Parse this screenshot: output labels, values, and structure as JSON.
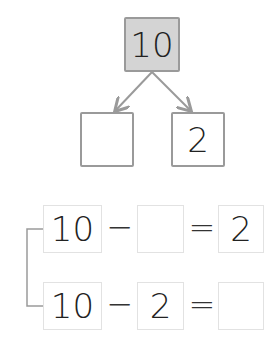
{
  "tree": {
    "whole": "10",
    "parts": [
      "",
      "2"
    ]
  },
  "equations": [
    {
      "a": "10",
      "op": "−",
      "b": "",
      "eq": "=",
      "result": "2"
    },
    {
      "a": "10",
      "op": "−",
      "b": "2",
      "eq": "=",
      "result": ""
    }
  ],
  "colors": {
    "whole_fill": "#d4d4d4",
    "line": "#9a9a9a"
  }
}
